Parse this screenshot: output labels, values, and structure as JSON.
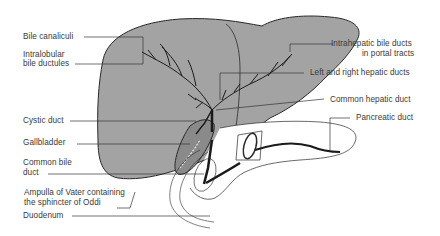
{
  "diagram": {
    "colors": {
      "liver_fill": "#a3a3a3",
      "outline": "#2a2a2a",
      "leader_line": "#333333",
      "label_text": "#3a3a3a",
      "background": "#ffffff"
    },
    "labels_left": [
      {
        "id": "bile-canaliculi",
        "text": "Bile canaliculi"
      },
      {
        "id": "intralobular-line1",
        "text": "Intralobular"
      },
      {
        "id": "intralobular-line2",
        "text": "bile ductules"
      },
      {
        "id": "cystic-duct",
        "text": "Cystic duct"
      },
      {
        "id": "gallbladder",
        "text": "Gallbladder"
      },
      {
        "id": "common-bile-line1",
        "text": "Common bile"
      },
      {
        "id": "common-bile-line2",
        "text": "duct"
      },
      {
        "id": "ampulla-line1",
        "text": "Ampulla of Vater containing"
      },
      {
        "id": "ampulla-line2",
        "text": "the sphincter of Oddi"
      },
      {
        "id": "duodenum",
        "text": "Duodenum"
      }
    ],
    "labels_right": [
      {
        "id": "intrahepatic-line1",
        "text": "Intrahepatic bile ducts"
      },
      {
        "id": "intrahepatic-line2",
        "text": "in portal tracts"
      },
      {
        "id": "hepatic-ducts",
        "text": "Left and right hepatic ducts"
      },
      {
        "id": "common-hepatic",
        "text": "Common hepatic duct"
      },
      {
        "id": "pancreatic-duct",
        "text": "Pancreatic duct"
      }
    ]
  }
}
